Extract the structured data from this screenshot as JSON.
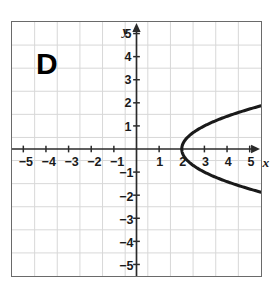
{
  "figure": {
    "panel_label": "D",
    "background_color": "#ffffff",
    "border_color": "#6a6a6a",
    "grid_color": "#d8d8d8",
    "axis_color": "#2a2a2a",
    "curve_color": "#1a1a1a"
  },
  "axes": {
    "x_axis_name": "x",
    "y_axis_name": "y",
    "x_tick_labels": [
      "-5",
      "-4",
      "-3",
      "-2",
      "-1",
      "1",
      "2",
      "3",
      "4",
      "5"
    ],
    "y_tick_labels_positive": [
      "5",
      "4",
      "3",
      "2",
      "1"
    ],
    "y_tick_labels_negative": [
      "-1",
      "-2",
      "-3",
      "-4",
      "-5"
    ]
  },
  "chart_data": {
    "type": "line",
    "title": "D",
    "xlabel": "x",
    "ylabel": "y",
    "xlim": [
      -5.6,
      5.6
    ],
    "ylim": [
      -5.6,
      5.6
    ],
    "xticks": [
      -5,
      -4,
      -3,
      -2,
      -1,
      1,
      2,
      3,
      4,
      5
    ],
    "yticks": [
      -5,
      -4,
      -3,
      -2,
      -1,
      1,
      2,
      3,
      4,
      5
    ],
    "grid": true,
    "legend": "none",
    "series": [
      {
        "name": "parabola opening right, vertex (2, 0)",
        "equation": "x = y^2 + 2",
        "vertex": [
          2,
          0
        ],
        "points": [
          [
            5.6,
            -1.9
          ],
          [
            4.0,
            -1.414
          ],
          [
            3.0,
            -1.0
          ],
          [
            2.5,
            -0.707
          ],
          [
            2.25,
            -0.5
          ],
          [
            2.0,
            0.0
          ],
          [
            2.25,
            0.5
          ],
          [
            2.5,
            0.707
          ],
          [
            3.0,
            1.0
          ],
          [
            4.0,
            1.414
          ],
          [
            5.6,
            1.9
          ]
        ]
      }
    ]
  }
}
